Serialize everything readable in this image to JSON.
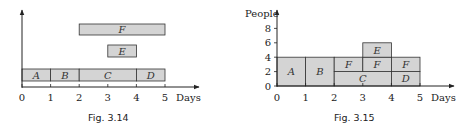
{
  "figures": [
    {
      "caption": "Fig. 3.14",
      "xlabel": "Days",
      "ylabel": "",
      "x_ticks": [
        "0",
        "1",
        "2",
        "3",
        "4",
        "5"
      ],
      "tasks": [
        {
          "name": "A",
          "start": 0,
          "end": 1,
          "row": 0
        },
        {
          "name": "B",
          "start": 1,
          "end": 2,
          "row": 0
        },
        {
          "name": "C",
          "start": 2,
          "end": 4,
          "row": 0
        },
        {
          "name": "D",
          "start": 4,
          "end": 5,
          "row": 0
        },
        {
          "name": "E",
          "start": 3,
          "end": 4,
          "row": 1
        },
        {
          "name": "F",
          "start": 2,
          "end": 5,
          "row": 2
        }
      ]
    },
    {
      "caption": "Fig. 3.15",
      "xlabel": "Days",
      "ylabel": "People",
      "x_ticks": [
        "0",
        "1",
        "2",
        "3",
        "4",
        "5"
      ],
      "y_ticks": [
        "0",
        "2",
        "4",
        "6",
        "8"
      ],
      "blocks": [
        {
          "name": "A",
          "x0": 0,
          "x1": 1,
          "y0": 0,
          "y1": 4
        },
        {
          "name": "B",
          "x0": 1,
          "x1": 2,
          "y0": 0,
          "y1": 4
        },
        {
          "name": "C",
          "x0": 2,
          "x1": 4,
          "y0": 0,
          "y1": 2
        },
        {
          "name": "F",
          "x0": 2,
          "x1": 3,
          "y0": 2,
          "y1": 4
        },
        {
          "name": "F",
          "x0": 3,
          "x1": 4,
          "y0": 2,
          "y1": 4
        },
        {
          "name": "E",
          "x0": 3,
          "x1": 4,
          "y0": 4,
          "y1": 6
        },
        {
          "name": "D",
          "x0": 4,
          "x1": 5,
          "y0": 0,
          "y1": 2
        },
        {
          "name": "F",
          "x0": 4,
          "x1": 5,
          "y0": 2,
          "y1": 4
        }
      ]
    }
  ],
  "chart_data": [
    {
      "type": "bar",
      "title": "Fig. 3.14",
      "subtype": "gantt",
      "xlabel": "Days",
      "ylabel": "",
      "xlim": [
        0,
        5
      ],
      "categories": [
        "A",
        "B",
        "C",
        "D",
        "E",
        "F"
      ],
      "series": [
        {
          "name": "start",
          "values": [
            0,
            1,
            2,
            4,
            3,
            2
          ]
        },
        {
          "name": "end",
          "values": [
            1,
            2,
            4,
            5,
            4,
            5
          ]
        }
      ],
      "grid": false
    },
    {
      "type": "bar",
      "title": "Fig. 3.15",
      "subtype": "resource-histogram",
      "xlabel": "Days",
      "ylabel": "People",
      "xlim": [
        0,
        5
      ],
      "ylim": [
        0,
        9
      ],
      "categories": [
        "0-1",
        "1-2",
        "2-3",
        "3-4",
        "4-5"
      ],
      "values": [
        4,
        4,
        4,
        6,
        4
      ],
      "series": [
        {
          "name": "A",
          "values": [
            4,
            0,
            0,
            0,
            0
          ]
        },
        {
          "name": "B",
          "values": [
            0,
            4,
            0,
            0,
            0
          ]
        },
        {
          "name": "C",
          "values": [
            0,
            0,
            2,
            2,
            0
          ]
        },
        {
          "name": "D",
          "values": [
            0,
            0,
            0,
            0,
            2
          ]
        },
        {
          "name": "E",
          "values": [
            0,
            0,
            0,
            2,
            0
          ]
        },
        {
          "name": "F",
          "values": [
            0,
            0,
            2,
            2,
            2
          ]
        }
      ],
      "grid": false
    }
  ],
  "colors": {
    "bar_fill": "#d4d4d4",
    "bar_stroke": "#333333",
    "axis": "#222222"
  }
}
